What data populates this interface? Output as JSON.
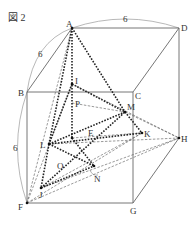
{
  "figure": {
    "title": "図 2",
    "edge_length_label": "6",
    "colors": {
      "edge": "#666666",
      "thick_dotted": "#222222",
      "thin_dashed": "#555555",
      "arc": "#888888"
    }
  },
  "labels": {
    "A": "A",
    "B": "B",
    "C": "C",
    "D": "D",
    "E": "E",
    "F": "F",
    "G": "G",
    "H": "H",
    "I": "I",
    "J": "J",
    "K": "K",
    "L": "L",
    "M": "M",
    "N": "N",
    "O": "O",
    "P": "P"
  },
  "dimensions": {
    "AD": "6",
    "AB": "6",
    "BF": "6"
  }
}
